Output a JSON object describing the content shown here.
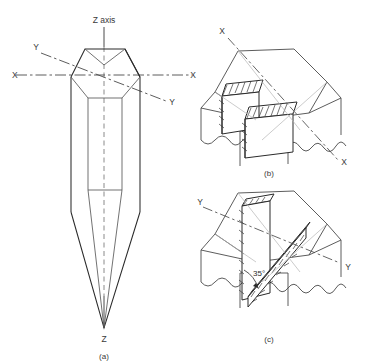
{
  "figure": {
    "title_present": false,
    "background_color": "#ffffff",
    "line_color": "#4a4a4a",
    "heavy_line_color": "#1d1d1d",
    "hatch_color": "#2b2b2b",
    "text_color": "#3a3a3a",
    "panels": [
      {
        "id": "a",
        "caption": "(a)",
        "description": "hexagonal crystal with crystallographic axes",
        "labels": {
          "z_axis_top": "Z axis",
          "z_axis_bottom": "Z",
          "x_left": "X",
          "x_right": "X",
          "y_upper_left": "Y",
          "y_lower_right": "Y"
        }
      },
      {
        "id": "b",
        "caption": "(b)",
        "description": "block with two parallel hatched planes parallel to the X-X axis",
        "labels": {
          "x_upper_left": "X",
          "x_lower_right": "X"
        }
      },
      {
        "id": "c",
        "caption": "(c)",
        "description": "block with two hatched planes inclined at 35 degrees about the Y-Y axis",
        "labels": {
          "y_upper_left": "Y",
          "y_lower_right": "Y",
          "angle": "35°"
        }
      }
    ]
  }
}
